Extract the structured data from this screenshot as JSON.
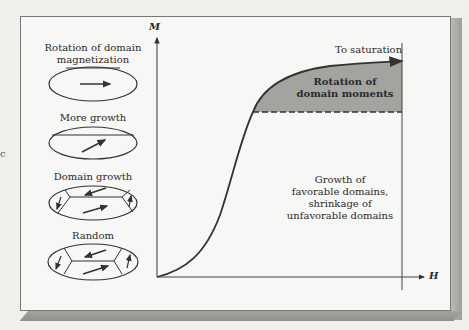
{
  "stray_char": "c",
  "axes": {
    "y_label": "M",
    "x_label": "H"
  },
  "domain_states": [
    {
      "label_line1": "Rotation of domain",
      "label_line2": "magnetization"
    },
    {
      "label_line1": "More growth"
    },
    {
      "label_line1": "Domain growth"
    },
    {
      "label_line1": "Random"
    }
  ],
  "regions": {
    "saturation": "To saturation",
    "rotation_line1": "Rotation of",
    "rotation_line2": "domain moments",
    "growth_line1": "Growth of",
    "growth_line2": "favorable domains,",
    "growth_line3": "shrinkage of",
    "growth_line4": "unfavorable domains"
  },
  "colors": {
    "background": "#efefec",
    "panel": "#f7f7f5",
    "shaded_region": "#9f9f9c",
    "line": "#333333"
  }
}
